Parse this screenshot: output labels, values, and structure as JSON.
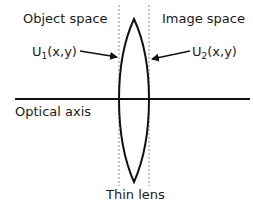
{
  "diagram": {
    "labels": {
      "object_space": "Object space",
      "image_space": "Image space",
      "u1_prefix": "U",
      "u1_sub": "1",
      "u1_suffix": "(x,y)",
      "u2_prefix": "U",
      "u2_sub": "2",
      "u2_suffix": "(x,y)",
      "optical_axis": "Optical axis",
      "thin_lens": "Thin lens"
    },
    "colors": {
      "stroke": "#111111",
      "dashed": "#8a8a8a",
      "background": "#ffffff"
    }
  }
}
